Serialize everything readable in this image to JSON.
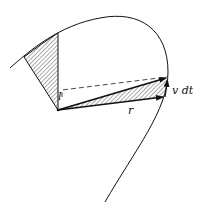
{
  "diagram": {
    "labels": {
      "position_vector": "r",
      "displacement": "v dt",
      "lever": "l"
    },
    "colors": {
      "stroke": "#111111",
      "hatch": "#555555",
      "background": "#ffffff"
    }
  }
}
